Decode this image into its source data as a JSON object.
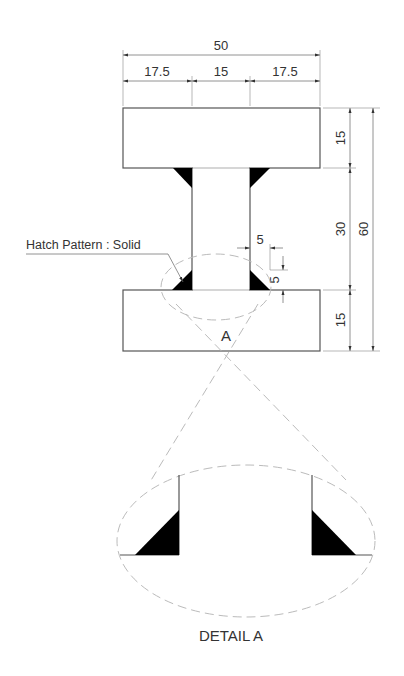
{
  "drawing": {
    "type": "I-beam cross-section with fillet welds",
    "colors": {
      "outline": "#555555",
      "dimension": "#777777",
      "hatch": "#000000",
      "detail_circle": "#bbbbbb",
      "text": "#333333"
    },
    "dimensions": {
      "overall_width": "50",
      "left_flange_overhang": "17.5",
      "web_width": "15",
      "right_flange_overhang": "17.5",
      "top_flange_thickness": "15",
      "web_height": "30",
      "bottom_flange_thickness": "15",
      "overall_height": "60",
      "fillet_horizontal": "5",
      "fillet_vertical": "5"
    },
    "annotations": {
      "hatch_label": "Hatch Pattern : Solid",
      "detail_marker": "A",
      "detail_title": "DETAIL A"
    }
  }
}
